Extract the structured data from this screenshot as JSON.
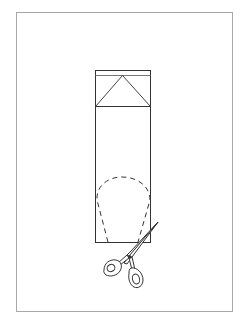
{
  "diagram": {
    "type": "paper-cutting-instruction",
    "elements": [
      {
        "name": "frame",
        "description": "page border"
      },
      {
        "name": "folded-paper-strip",
        "description": "tall rectangle strip of paper"
      },
      {
        "name": "folded-top-triangle",
        "description": "triangle fold at top of strip"
      },
      {
        "name": "dashed-cut-line",
        "description": "teardrop/rounded dashed cut outline"
      },
      {
        "name": "scissors",
        "description": "scissors cutting along dashed line"
      }
    ],
    "colors": {
      "stroke": "#333333",
      "frame": "#a8a8a8",
      "background": "#ffffff"
    }
  }
}
